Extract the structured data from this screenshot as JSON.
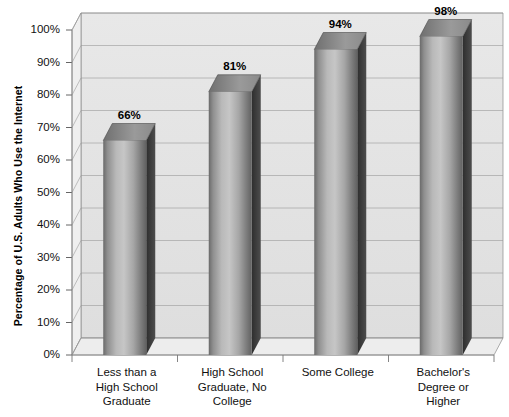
{
  "chart_data": {
    "type": "bar",
    "title": "",
    "subtitle": "",
    "xlabel": "",
    "ylabel": "Percentage of U.S. Adults Who Use the Internet",
    "categories": [
      "Less than a\nHigh School\nGraduate",
      "High School\nGraduate, No\nCollege",
      "Some College",
      "Bachelor's\nDegree or\nHigher"
    ],
    "values": [
      66,
      81,
      94,
      98
    ],
    "value_labels": [
      "66%",
      "81%",
      "94%",
      "98%"
    ],
    "ylim": [
      0,
      100
    ],
    "ytick_values": [
      0,
      10,
      20,
      30,
      40,
      50,
      60,
      70,
      80,
      90,
      100
    ],
    "ytick_labels": [
      "0%",
      "10%",
      "20%",
      "30%",
      "40%",
      "50%",
      "60%",
      "70%",
      "80%",
      "90%",
      "100%"
    ],
    "grid": true,
    "legend": "none",
    "style": "3d-column",
    "colors": {
      "bar_front_dark": "#5b5b5b",
      "bar_front_light": "#c9c9c9",
      "bar_side": "#3a3a3a",
      "bar_top": "#8e8e8e",
      "wall_back": "#e3e3e3",
      "wall_side": "#efefef",
      "floor": "#ededed",
      "gridline": "#9a9a9a",
      "axis_line": "#8a8a8a",
      "text": "#111111",
      "background": "#ffffff"
    }
  },
  "axis": {
    "y_title": "Percentage of U.S. Adults Who Use the Internet"
  }
}
